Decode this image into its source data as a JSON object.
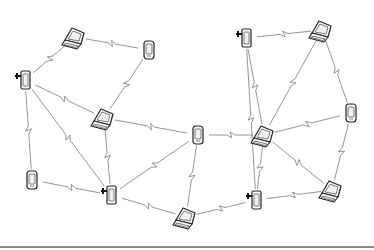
{
  "diagram": {
    "nodes": [
      {
        "id": "n1",
        "type": "laptop",
        "x": 75,
        "y": 37
      },
      {
        "id": "n2",
        "type": "phone",
        "x": 149,
        "y": 50
      },
      {
        "id": "n3",
        "type": "radio-phone",
        "x": 25,
        "y": 80
      },
      {
        "id": "n4",
        "type": "laptop",
        "x": 104,
        "y": 118
      },
      {
        "id": "n5",
        "type": "phone",
        "x": 198,
        "y": 135
      },
      {
        "id": "n6",
        "type": "radio-phone",
        "x": 246,
        "y": 38
      },
      {
        "id": "n7",
        "type": "laptop",
        "x": 322,
        "y": 30
      },
      {
        "id": "n8",
        "type": "phone",
        "x": 351,
        "y": 113
      },
      {
        "id": "n9",
        "type": "laptop",
        "x": 264,
        "y": 135
      },
      {
        "id": "n10",
        "type": "laptop",
        "x": 332,
        "y": 190
      },
      {
        "id": "n11",
        "type": "radio-phone",
        "x": 256,
        "y": 200
      },
      {
        "id": "n12",
        "type": "laptop",
        "x": 186,
        "y": 217
      },
      {
        "id": "n13",
        "type": "radio-phone",
        "x": 111,
        "y": 195
      },
      {
        "id": "n14",
        "type": "phone",
        "x": 32,
        "y": 180
      }
    ],
    "links": [
      [
        "n1",
        "n2"
      ],
      [
        "n1",
        "n3"
      ],
      [
        "n2",
        "n4"
      ],
      [
        "n3",
        "n4"
      ],
      [
        "n3",
        "n13"
      ],
      [
        "n3",
        "n14"
      ],
      [
        "n4",
        "n5"
      ],
      [
        "n4",
        "n13"
      ],
      [
        "n5",
        "n13"
      ],
      [
        "n5",
        "n12"
      ],
      [
        "n5",
        "n9"
      ],
      [
        "n6",
        "n7"
      ],
      [
        "n6",
        "n11"
      ],
      [
        "n6",
        "n9"
      ],
      [
        "n7",
        "n9"
      ],
      [
        "n7",
        "n8"
      ],
      [
        "n8",
        "n9"
      ],
      [
        "n8",
        "n10"
      ],
      [
        "n9",
        "n10"
      ],
      [
        "n9",
        "n11"
      ],
      [
        "n10",
        "n11"
      ],
      [
        "n11",
        "n12"
      ],
      [
        "n12",
        "n13"
      ],
      [
        "n13",
        "n14"
      ]
    ],
    "link_style": "wireless-zigzag"
  }
}
